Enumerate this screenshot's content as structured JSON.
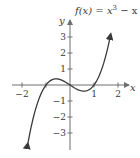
{
  "chart_data": {
    "type": "line",
    "title_parts": {
      "lhs": "f(x) = x",
      "exp": "3",
      "rhs": " − x"
    },
    "xlabel": "x",
    "ylabel": "y",
    "xlim": [
      -2.1,
      2.4
    ],
    "ylim": [
      -3.9,
      4.0
    ],
    "x_ticks": [
      -2,
      -1,
      1,
      2
    ],
    "x_tick_labels": [
      "−2",
      "",
      "1",
      "2"
    ],
    "y_ticks": [
      -3,
      -2,
      -1,
      1,
      2,
      3
    ],
    "y_tick_labels": [
      "−3",
      "−2",
      "−1",
      "1",
      "2",
      "3"
    ],
    "grid": false,
    "legend": "none",
    "series": [
      {
        "name": "f(x) = x^3 - x",
        "x": [
          -1.75,
          -1.5,
          -1.25,
          -1.0,
          -0.75,
          -0.577,
          -0.5,
          -0.25,
          0.0,
          0.25,
          0.5,
          0.577,
          0.75,
          1.0,
          1.25,
          1.5,
          1.7
        ],
        "values": [
          -3.61,
          -1.875,
          -0.703,
          0.0,
          0.328,
          0.385,
          0.375,
          0.234,
          0.0,
          -0.234,
          -0.375,
          -0.385,
          -0.328,
          0.0,
          0.703,
          1.875,
          3.21
        ],
        "arrows_both_ends": true,
        "color": "#3a3a3a"
      }
    ]
  },
  "style": {
    "axis_color": "#6e6e6e",
    "curve_color": "#3a3a3a"
  }
}
